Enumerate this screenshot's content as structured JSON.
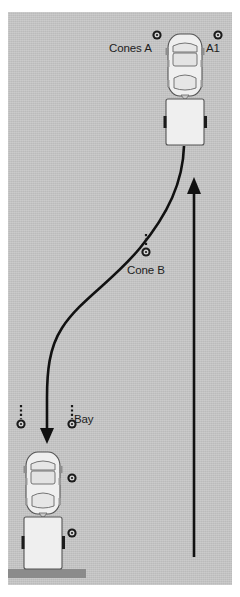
{
  "scene": {
    "title": "Trailer reversing manoeuvre diagram",
    "surface_color": "#c2c2c2",
    "curb_color": "#8b8b8b",
    "line_color": "#111111",
    "vehicle_body_color": "#efefef",
    "vehicle_outline_color": "#4d4d4d"
  },
  "labels": {
    "cones_a": "Cones A",
    "a1": "A1",
    "cone_b": "Cone B",
    "bay": "Bay"
  },
  "markers": [
    {
      "name": "cone-a-left",
      "label_ref": "cones_a",
      "x": 157,
      "y": 35,
      "has_stem": false
    },
    {
      "name": "cone-a1",
      "label_ref": "a1",
      "x": 218,
      "y": 35,
      "has_stem": false
    },
    {
      "name": "cone-b",
      "label_ref": "cone_b",
      "x": 146,
      "y": 252,
      "has_stem": true
    },
    {
      "name": "cone-bay-far-left",
      "label_ref": "",
      "x": 21,
      "y": 424,
      "has_stem": true
    },
    {
      "name": "cone-bay-left",
      "label_ref": "",
      "x": 72,
      "y": 424,
      "has_stem": true
    },
    {
      "name": "cone-bay-side-top",
      "label_ref": "",
      "x": 72,
      "y": 478,
      "has_stem": false
    },
    {
      "name": "cone-bay-side-bottom",
      "label_ref": "",
      "x": 72,
      "y": 533,
      "has_stem": false
    }
  ],
  "vehicles": [
    {
      "name": "car-start",
      "x": 168,
      "y": 34,
      "width": 34,
      "height": 62,
      "kind": "car"
    },
    {
      "name": "trailer-start",
      "x": 166,
      "y": 99,
      "width": 38,
      "height": 46,
      "kind": "trailer"
    },
    {
      "name": "car-finish",
      "x": 26,
      "y": 452,
      "width": 34,
      "height": 62,
      "kind": "car"
    },
    {
      "name": "trailer-finish",
      "x": 24,
      "y": 517,
      "width": 38,
      "height": 52,
      "kind": "trailer"
    }
  ],
  "paths": {
    "reverse_path": {
      "name": "reverse-curve-path",
      "d": "M 184 146 C 183 182 168 214 140 248 C 112 282 80 300 62 328 C 49 348 47 372 47 398 L 47 430",
      "arrow_direction": "down",
      "arrow_tip": {
        "x": 47,
        "y": 443
      }
    },
    "approach_path": {
      "name": "forward-approach-arrow",
      "d": "M 194 556 L 194 192",
      "arrow_direction": "up",
      "arrow_tip": {
        "x": 194,
        "y": 178
      }
    }
  }
}
